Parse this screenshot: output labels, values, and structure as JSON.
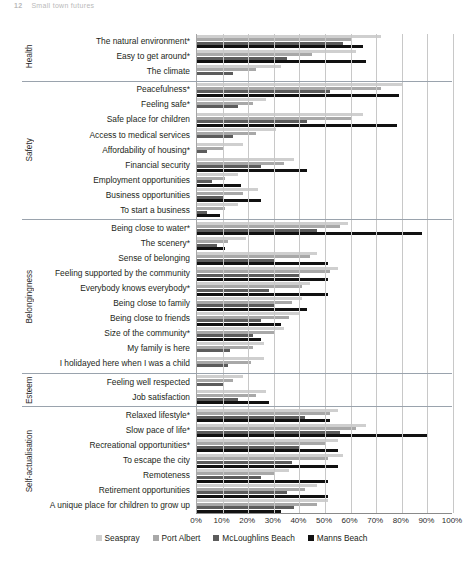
{
  "page_header": {
    "page_number": "12",
    "text": "Small town futures"
  },
  "chart_data": {
    "type": "bar",
    "orientation": "horizontal",
    "title": "",
    "xlabel": "",
    "ylabel": "",
    "xlim": [
      0,
      100
    ],
    "xticks": [
      "0%",
      "10%",
      "20%",
      "30%",
      "40%",
      "50%",
      "60%",
      "70%",
      "80%",
      "90%",
      "100%"
    ],
    "grid": true,
    "legend_position": "bottom",
    "series": [
      {
        "name": "Seaspray",
        "color": "#cfcfcf"
      },
      {
        "name": "Port Albert",
        "color": "#a8a8a8"
      },
      {
        "name": "McLoughlins Beach",
        "color": "#5c5c5c"
      },
      {
        "name": "Manns Beach",
        "color": "#111111"
      }
    ],
    "groups": [
      {
        "name": "Health",
        "categories": [
          {
            "label": "The natural environment*",
            "values": [
              72,
              60,
              57,
              65
            ]
          },
          {
            "label": "Easy to get around*",
            "values": [
              62,
              45,
              35,
              66
            ]
          },
          {
            "label": "The climate",
            "values": [
              33,
              23,
              14,
              0
            ]
          }
        ]
      },
      {
        "name": "Safety",
        "categories": [
          {
            "label": "Peacefulness*",
            "values": [
              80,
              72,
              52,
              79
            ]
          },
          {
            "label": "Feeling safe*",
            "values": [
              27,
              22,
              16,
              0
            ]
          },
          {
            "label": "Safe place for children",
            "values": [
              65,
              60,
              43,
              78
            ]
          },
          {
            "label": "Access to medical services",
            "values": [
              31,
              23,
              14,
              0
            ]
          },
          {
            "label": "Affordability of housing*",
            "values": [
              18,
              10,
              4,
              0
            ]
          },
          {
            "label": "Financial security",
            "values": [
              38,
              34,
              25,
              43
            ]
          },
          {
            "label": "Employment opportunities",
            "values": [
              16,
              11,
              6,
              17
            ]
          },
          {
            "label": "Business opportunities",
            "values": [
              24,
              18,
              10,
              25
            ]
          },
          {
            "label": "To start a business",
            "values": [
              16,
              11,
              4,
              9
            ]
          }
        ]
      },
      {
        "name": "Belongingness",
        "categories": [
          {
            "label": "Being close to water*",
            "values": [
              59,
              56,
              47,
              88
            ]
          },
          {
            "label": "The scenery*",
            "values": [
              19,
              12,
              8,
              11
            ]
          },
          {
            "label": "Sense of belonging",
            "values": [
              47,
              44,
              30,
              51
            ]
          },
          {
            "label": "Feeling supported by the community",
            "values": [
              55,
              52,
              40,
              51
            ]
          },
          {
            "label": "Everybody knows everybody*",
            "values": [
              44,
              41,
              28,
              51
            ]
          },
          {
            "label": "Being close to family",
            "values": [
              41,
              37,
              30,
              43
            ]
          },
          {
            "label": "Being close to friends",
            "values": [
              40,
              36,
              25,
              33
            ]
          },
          {
            "label": "Size of the community*",
            "values": [
              34,
              30,
              22,
              25
            ]
          },
          {
            "label": "My family is here",
            "values": [
              26,
              22,
              13,
              0
            ]
          },
          {
            "label": "I holidayed here when I was a child",
            "values": [
              26,
              21,
              12,
              0
            ]
          }
        ]
      },
      {
        "name": "Esteem",
        "categories": [
          {
            "label": "Feeling well respected",
            "values": [
              18,
              14,
              10,
              0
            ]
          },
          {
            "label": "Job satisfaction",
            "values": [
              27,
              23,
              16,
              28
            ]
          }
        ]
      },
      {
        "name": "Self-actualisation",
        "categories": [
          {
            "label": "Relaxed lifestyle*",
            "values": [
              55,
              52,
              42,
              52
            ]
          },
          {
            "label": "Slow pace of life*",
            "values": [
              66,
              62,
              56,
              90
            ]
          },
          {
            "label": "Recreational opportunities*",
            "values": [
              55,
              50,
              40,
              55
            ]
          },
          {
            "label": "To escape the city",
            "values": [
              57,
              51,
              37,
              55
            ]
          },
          {
            "label": "Remoteness",
            "values": [
              36,
              30,
              25,
              51
            ]
          },
          {
            "label": "Retirement opportunities",
            "values": [
              47,
              42,
              35,
              51
            ]
          },
          {
            "label": "A unique place for children to grow up",
            "values": [
              51,
              47,
              38,
              33
            ]
          }
        ]
      }
    ]
  }
}
